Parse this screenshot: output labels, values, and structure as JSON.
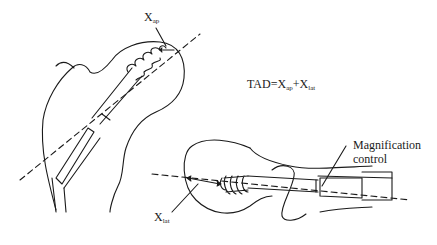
{
  "figure": {
    "formula": {
      "lhs": "TAD=X",
      "sub1": "ap",
      "mid": "+X",
      "sub2": "lat"
    },
    "labels": {
      "xap": {
        "main": "X",
        "sub": "ap"
      },
      "xlat": {
        "main": "X",
        "sub": "lat"
      },
      "magnification": {
        "line1": "Magnification",
        "line2": "control"
      }
    },
    "views": {
      "ap": "Anteroposterior view of proximal femur with lag screw",
      "lateral": "Lateral view of proximal femur with lag screw"
    },
    "colors": {
      "line": "#1a1a1a",
      "background": "#ffffff"
    }
  }
}
